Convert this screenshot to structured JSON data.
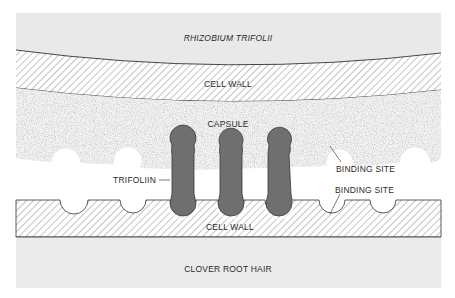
{
  "diagram": {
    "labels": {
      "bacterium": "RHIZOBIUM TRIFOLII",
      "upper_cell_wall": "CELL WALL",
      "capsule": "CAPSULE",
      "trifoliin": "TRIFOLIIN",
      "binding_site_upper": "BINDING SITE",
      "binding_site_lower": "BINDING SITE",
      "lower_cell_wall": "CELL WALL",
      "root_hair": "CLOVER ROOT HAIR"
    },
    "regions": [
      {
        "name": "Rhizobium trifolii",
        "fill": "#e8e8e8"
      },
      {
        "name": "bacterial cell wall",
        "pattern": "hatched"
      },
      {
        "name": "capsule",
        "pattern": "stippled"
      },
      {
        "name": "root hair cell wall",
        "pattern": "hatched"
      },
      {
        "name": "clover root hair",
        "fill": "#ebebeb"
      }
    ],
    "trifoliin_count": 3,
    "trifoliin_color": "#6f6f6f",
    "empty_binding_sites_upper": 4,
    "empty_binding_sites_lower": 4
  }
}
